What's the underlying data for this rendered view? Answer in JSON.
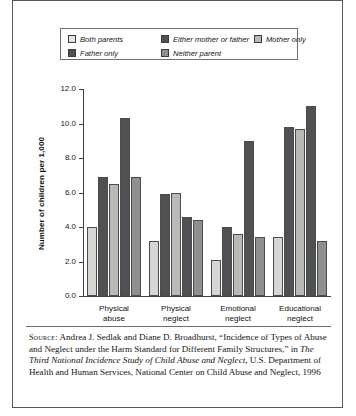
{
  "chart_data": {
    "type": "bar",
    "title": "",
    "xlabel": "",
    "ylabel": "Number of children per 1,000",
    "ylim": [
      0,
      12
    ],
    "ytick_step": 2,
    "ytick_labels": [
      "0.0",
      "2.0",
      "4.0",
      "6.0",
      "8.0",
      "10.0",
      "12.0"
    ],
    "grid": false,
    "legend_position": "top",
    "categories": [
      "Physical abuse",
      "Physical neglect",
      "Emotional neglect",
      "Educational neglect"
    ],
    "category_lines": [
      [
        "Physical",
        "abuse"
      ],
      [
        "Physical",
        "neglect"
      ],
      [
        "Emotional",
        "neglect"
      ],
      [
        "Educational",
        "neglect"
      ]
    ],
    "series": [
      {
        "name": "Both parents",
        "color": "#d6d6d2",
        "values": [
          4.0,
          3.2,
          2.1,
          3.4
        ]
      },
      {
        "name": "Either mother or father",
        "color": "#4f5153",
        "values": [
          6.9,
          5.9,
          4.0,
          9.8
        ]
      },
      {
        "name": "Mother only",
        "color": "#b9bab5",
        "values": [
          6.5,
          6.0,
          3.6,
          9.7
        ]
      },
      {
        "name": "Father only",
        "color": "#4f5153",
        "values": [
          10.3,
          4.6,
          9.0,
          11.0
        ]
      },
      {
        "name": "Neither parent",
        "color": "#8e908d",
        "values": [
          6.9,
          4.4,
          3.4,
          3.2
        ]
      }
    ]
  },
  "legend": {
    "rows": [
      [
        {
          "label": "Both parents",
          "color": "#e4e4e0"
        },
        {
          "label": "Either mother or father",
          "color": "#4f5153"
        },
        {
          "label": "Mother only",
          "color": "#b9bab5"
        }
      ],
      [
        {
          "label": "Father only",
          "color": "#4f5153"
        },
        {
          "label": "Neither parent",
          "color": "#8e908d"
        }
      ]
    ]
  },
  "source": {
    "label": "Source:",
    "text_1": " Andrea J. Sedlak and Diane D. Broadhurst, “Incidence of Types of Abuse and Neglect under the Harm Standard for Different Family Structures,” in ",
    "italic_1": "The Third National Incidence Study of Child Abuse and Neglect,",
    "text_2": " U.S. Department of Health and Human Services, National Center on Child Abuse and Neglect, 1996"
  }
}
